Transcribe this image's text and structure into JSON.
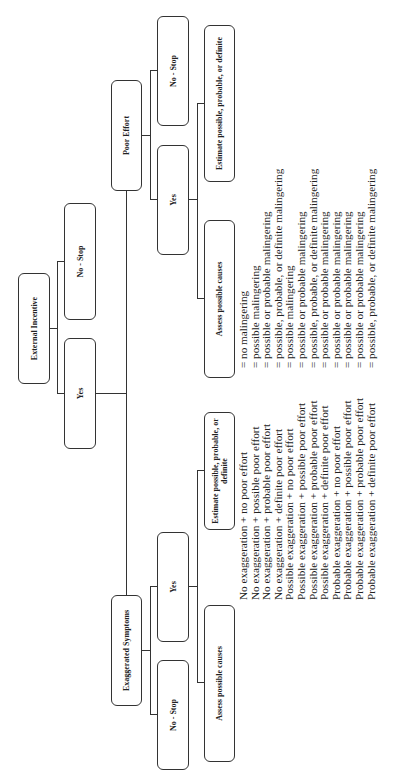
{
  "diagram": {
    "root": {
      "label": "External Incentive"
    },
    "root_yes": {
      "label": "Yes"
    },
    "root_no": {
      "label": "No - Stop"
    },
    "left_branch": {
      "label": "Exaggerated Symptoms",
      "yes": {
        "label": "Yes"
      },
      "no": {
        "label": "No - Stop"
      },
      "assess": {
        "label": "Assess possible causes"
      },
      "estimate": {
        "label": "Estimate possible, probable, or definite"
      }
    },
    "right_branch": {
      "label": "Poor Effort",
      "yes": {
        "label": "Yes"
      },
      "no": {
        "label": "No - Stop"
      },
      "assess": {
        "label": "Assess possible causes"
      },
      "estimate": {
        "label": "Estimate possible, probable, or definite"
      }
    },
    "combinations": [
      "No exaggeration + no poor effort",
      "No exaggeration + possible poor effort",
      "No exaggeration + probable poor effort",
      "No exaggeration + definite poor effort",
      "Possible exaggeration + no poor effort",
      "Possible exaggeration + possible poor effort",
      "Possible exaggeration + probable poor effort",
      "Possible exaggeration + definite poor effort",
      "Probable exaggeration + no poor effort",
      "Probable exaggeration + possible poor effort",
      "Probable exaggeration + probable poor effort",
      "Probable exaggeration + definite poor effort"
    ],
    "outcomes": [
      "= no malingering",
      "= possible malingering",
      "= possible or probable malingering",
      "= possible, probable, or definite malingering",
      "= possible malingering",
      "= possible or probable malingering",
      "= possible, probable, or definite malingering",
      "= possible or probable malingering",
      "= possible or probable malingering",
      "= possible or probable malingering",
      "= possible or probable malingering",
      "= possible, probable, or definite malingering"
    ]
  }
}
